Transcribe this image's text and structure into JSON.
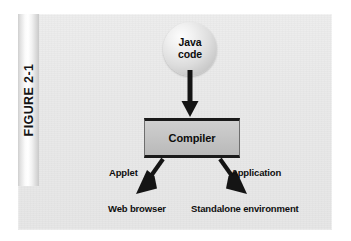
{
  "figure": {
    "tab_label": "FIGURE 2-1"
  },
  "diagram": {
    "source_node": {
      "icon": "sphere-node-icon",
      "line1": "Java",
      "line2": "code"
    },
    "process_box": {
      "label": "Compiler"
    },
    "branches": [
      {
        "edge_label": "Applet",
        "target_label": "Web browser",
        "arrow_icon": "arrow-down-left-icon"
      },
      {
        "edge_label": "Application",
        "target_label": "Standalone environment",
        "arrow_icon": "arrow-down-right-icon"
      }
    ],
    "main_arrow": {
      "icon": "arrow-down-icon"
    }
  },
  "colors": {
    "panel_background": "#e9e9e9",
    "page_background": "#ffffff",
    "box_fill": "#c3c3c3",
    "stroke": "#1a1a1a",
    "text": "#0f0f0f"
  }
}
